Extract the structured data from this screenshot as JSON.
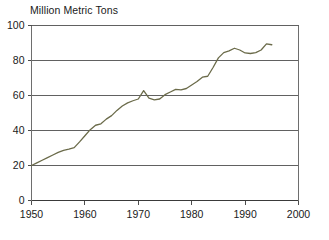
{
  "chart_data": {
    "type": "line",
    "title": "Million Metric Tons",
    "xlabel": "",
    "ylabel": "Million Metric Tons",
    "xlim": [
      1950,
      2000
    ],
    "ylim": [
      0,
      100
    ],
    "grid": true,
    "legend": "none",
    "line_color": "#6b6b4a",
    "axis_color": "#3a3a3a",
    "xticks": [
      1950,
      1960,
      1970,
      1980,
      1990,
      2000
    ],
    "yticks": [
      0,
      20,
      40,
      60,
      80,
      100
    ],
    "x": [
      1950,
      1951,
      1952,
      1953,
      1954,
      1955,
      1956,
      1957,
      1958,
      1959,
      1960,
      1961,
      1962,
      1963,
      1964,
      1965,
      1966,
      1967,
      1968,
      1969,
      1970,
      1971,
      1972,
      1973,
      1974,
      1975,
      1976,
      1977,
      1978,
      1979,
      1980,
      1981,
      1982,
      1983,
      1984,
      1985,
      1986,
      1987,
      1988,
      1989,
      1990,
      1991,
      1992,
      1993,
      1994,
      1995
    ],
    "values": [
      20.0,
      21.5,
      23.0,
      24.5,
      26.0,
      27.5,
      28.6,
      29.3,
      30.2,
      33.5,
      37.0,
      40.5,
      43.0,
      43.8,
      46.5,
      48.5,
      51.5,
      54.0,
      55.8,
      57.0,
      58.0,
      62.8,
      58.5,
      57.5,
      58.0,
      60.5,
      62.0,
      63.5,
      63.2,
      64.0,
      66.0,
      68.0,
      70.5,
      71.0,
      76.0,
      81.5,
      84.5,
      85.5,
      87.0,
      86.0,
      84.3,
      84.0,
      84.5,
      86.0,
      89.5,
      89.0
    ]
  },
  "series_name": "value"
}
